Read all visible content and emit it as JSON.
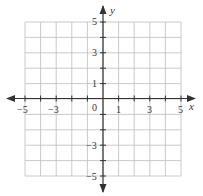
{
  "diagram": {
    "type": "coordinate-plane",
    "x_axis": {
      "label": "x",
      "min": -5,
      "max": 5,
      "tick_labels": [
        "-5",
        "-3",
        "1",
        "3",
        "5"
      ]
    },
    "y_axis": {
      "label": "y",
      "min": -5,
      "max": 5,
      "tick_labels": [
        "5",
        "3",
        "1",
        "-3",
        "-5"
      ]
    },
    "origin_label": "0",
    "grid": {
      "cells_x": 10,
      "cells_y": 10,
      "color": "#b8b8b8"
    },
    "axis_color": "#333333"
  },
  "labels": {
    "x_axis": "x",
    "y_axis": "y",
    "origin": "0",
    "x_neg5": "−5",
    "x_neg3": "−3",
    "x_1": "1",
    "x_3": "3",
    "x_5": "5",
    "y_5": "5",
    "y_3": "3",
    "y_1": "1",
    "y_neg3": "−3",
    "y_neg5": "−5"
  }
}
